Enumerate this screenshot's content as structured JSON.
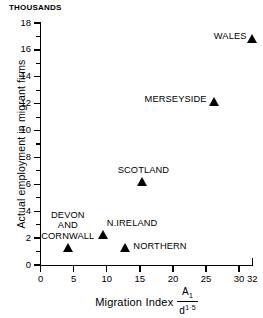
{
  "units_label": "THOUSANDS",
  "chart_data": {
    "type": "scatter",
    "title": "",
    "xlabel": "Migration Index A1/d1·5",
    "ylabel": "Actual employment in migrant firms",
    "units": "THOUSANDS",
    "xlim": [
      0,
      32
    ],
    "ylim": [
      0,
      18
    ],
    "grid": false,
    "legend": "none",
    "x_ticks": [
      0,
      5,
      10,
      15,
      20,
      25,
      30,
      32
    ],
    "x_tick_labels": [
      "0",
      "5",
      "10",
      "15",
      "20",
      "25",
      "30",
      "32"
    ],
    "y_ticks": [
      0,
      2,
      4,
      6,
      8,
      10,
      12,
      14,
      16,
      18
    ],
    "y_tick_labels": [
      "0",
      "2",
      "4",
      "6",
      "8",
      "10",
      "12",
      "14",
      "16",
      "18"
    ],
    "y_minor_ticks": [
      1,
      3,
      5,
      7,
      9,
      11,
      13,
      15,
      17
    ],
    "marker": "filled-triangle",
    "points": [
      {
        "label": "WALES",
        "x": 32,
        "y": 16.6,
        "label_pos": "left"
      },
      {
        "label": "MERSEYSIDE",
        "x": 26.3,
        "y": 11.9,
        "label_pos": "left"
      },
      {
        "label": "SCOTLAND",
        "x": 15.4,
        "y": 5.9,
        "label_pos": "above"
      },
      {
        "label": "N.IRELAND",
        "x": 9.4,
        "y": 2.0,
        "label_pos": "above-right"
      },
      {
        "label": "DEVON AND CORNWALL",
        "x": 4.1,
        "y": 1.0,
        "label_pos": "above-left"
      },
      {
        "label": "NORTHERN",
        "x": 12.8,
        "y": 1.0,
        "label_pos": "right"
      }
    ]
  },
  "axis_title_x": {
    "text": "Migration Index",
    "numerator": "A",
    "numerator_sub": "1",
    "denominator": "d",
    "denominator_sup": "1·5"
  },
  "axis_title_y": "Actual employment in migrant firms",
  "point_labels": {
    "wales": "WALES",
    "merseyside": "MERSEYSIDE",
    "scotland": "SCOTLAND",
    "n_ireland": "N.IRELAND",
    "devon_line1": "DEVON",
    "devon_line2": "AND",
    "devon_line3": "CORNWALL",
    "northern": "NORTHERN"
  },
  "colors": {
    "ink": "#000000",
    "background": "#ffffff"
  }
}
